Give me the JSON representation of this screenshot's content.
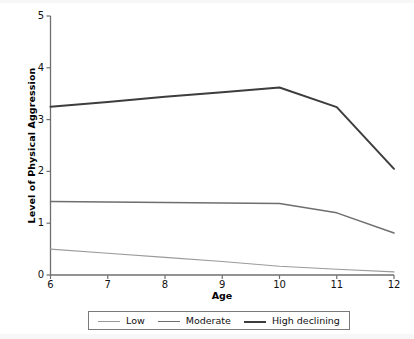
{
  "chart_data": {
    "type": "line",
    "title": "",
    "xlabel": "Age",
    "ylabel": "Level of Physical Aggression",
    "x": [
      6,
      7,
      8,
      9,
      10,
      11,
      12
    ],
    "xtick_labels": [
      "6",
      "7",
      "8",
      "9",
      "10",
      "11",
      "12"
    ],
    "ytick_labels": [
      "0",
      "1",
      "2",
      "3",
      "4",
      "5"
    ],
    "yticks": [
      0,
      1,
      2,
      3,
      4,
      5
    ],
    "xlim": [
      6,
      12
    ],
    "ylim": [
      0,
      5
    ],
    "grid": false,
    "legend_position": "below-axis",
    "series": [
      {
        "name": "Low",
        "values": [
          0.5,
          0.42,
          0.34,
          0.26,
          0.17,
          0.11,
          0.06
        ],
        "color": "#9a9a9a",
        "width": 1.1
      },
      {
        "name": "Moderate",
        "values": [
          1.42,
          1.41,
          1.4,
          1.39,
          1.38,
          1.2,
          0.81
        ],
        "color": "#6e6e6e",
        "width": 1.5
      },
      {
        "name": "High declining",
        "values": [
          3.25,
          3.34,
          3.44,
          3.53,
          3.62,
          3.24,
          2.05
        ],
        "color": "#3d3d3d",
        "width": 2.0
      }
    ]
  },
  "legend": {
    "items": [
      {
        "label": "Low"
      },
      {
        "label": "Moderate"
      },
      {
        "label": "High declining"
      }
    ]
  },
  "axes": {
    "axis_color": "#6f6f6f",
    "tick_color": "#6f6f6f"
  }
}
